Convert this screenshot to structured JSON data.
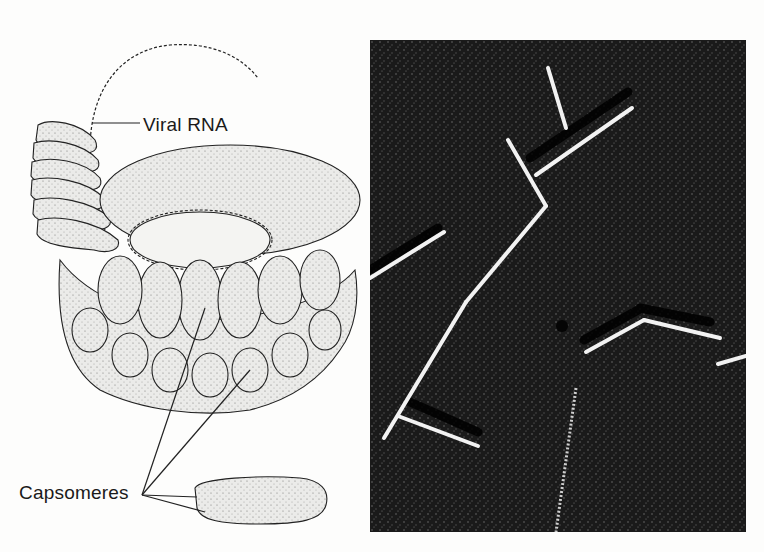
{
  "figure": {
    "left_panel": {
      "type": "illustration",
      "subject": "tobacco mosaic virus helical structure",
      "labels": {
        "viral_rna": "Viral RNA",
        "capsomeres": "Capsomeres"
      }
    },
    "right_panel": {
      "type": "electron-micrograph",
      "subject": "rod-shaped virus particles"
    },
    "colors": {
      "background": "#fdfdfc",
      "ink": "#1a1a1a",
      "capsomere_fill": "#e8e8e6",
      "micrograph_bg": "#151515",
      "rod_highlight": "#f2f2f2"
    }
  }
}
